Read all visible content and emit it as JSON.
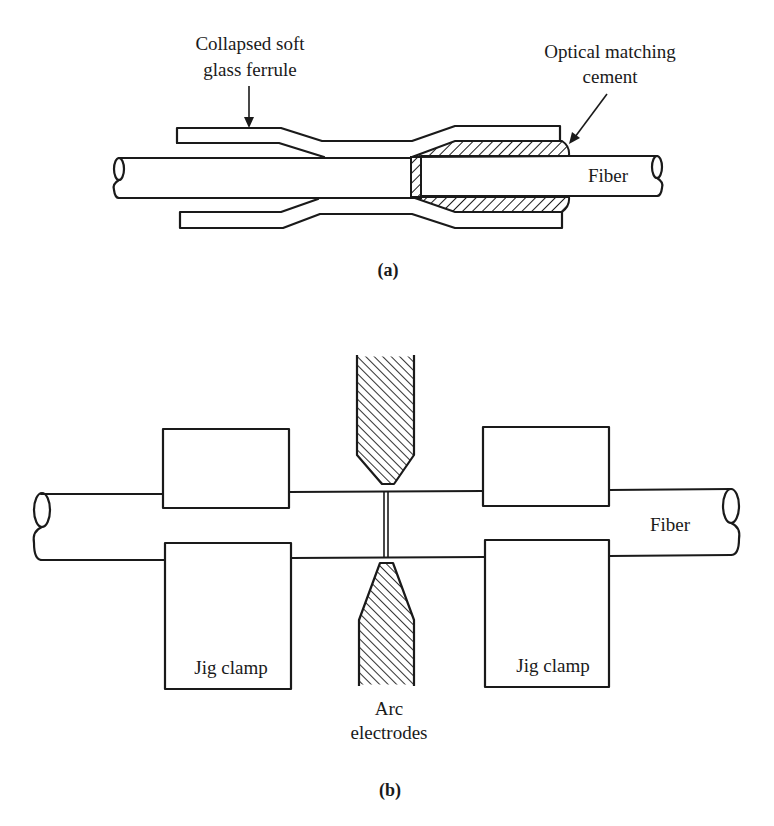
{
  "figure": {
    "part_a": {
      "caption": "(a)",
      "labels": {
        "ferrule_line1": "Collapsed soft",
        "ferrule_line2": "glass ferrule",
        "cement_line1": "Optical matching",
        "cement_line2": "cement",
        "fiber": "Fiber"
      },
      "components": [
        "fiber-left",
        "fiber-right",
        "collapsed-glass-ferrule",
        "optical-matching-cement"
      ]
    },
    "part_b": {
      "caption": "(b)",
      "labels": {
        "fiber": "Fiber",
        "left_clamp": "Jig clamp",
        "right_clamp": "Jig clamp",
        "electrodes_line1": "Arc",
        "electrodes_line2": "electrodes"
      },
      "components": [
        "fiber",
        "left-jig-clamp-top",
        "left-jig-clamp-bottom",
        "right-jig-clamp-top",
        "right-jig-clamp-bottom",
        "arc-electrode-top",
        "arc-electrode-bottom"
      ]
    },
    "colors": {
      "ink": "#1a1a1a",
      "background": "#ffffff"
    }
  }
}
